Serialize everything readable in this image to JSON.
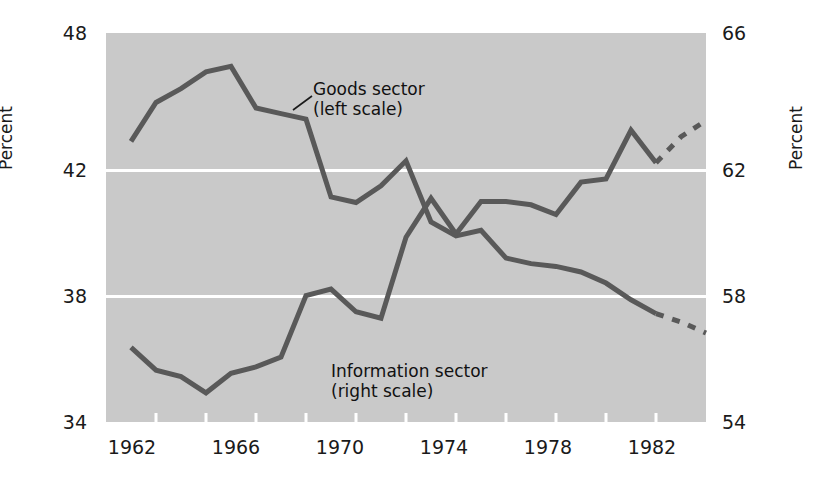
{
  "chart_data": {
    "type": "line",
    "title": "",
    "xlabel": "",
    "ylabel": "Percent",
    "ylabel_right": "Percent",
    "xlim": [
      1962,
      1986
    ],
    "ylim_left": [
      34,
      48
    ],
    "ylim_right": [
      54,
      66
    ],
    "grid": true,
    "gridlines_left": [
      42,
      38
    ],
    "legend": "inline annotations",
    "x_ticks_labeled": [
      "1962",
      "1966",
      "1970",
      "1974",
      "1978",
      "1982"
    ],
    "x_tick_values_labeled": [
      1962,
      1966,
      1970,
      1974,
      1978,
      1982
    ],
    "x_tick_interval_years": 2,
    "y_ticks_left": [
      "48",
      "42",
      "38",
      "34"
    ],
    "y_tick_values_left": [
      48,
      42,
      38,
      34
    ],
    "y_ticks_right": [
      "66",
      "62",
      "58",
      "54"
    ],
    "y_tick_values_right": [
      66,
      62,
      58,
      54
    ],
    "annotations": [
      {
        "name": "goods-sector",
        "line1": "Goods sector",
        "line2": "(left scale)"
      },
      {
        "name": "information-sector",
        "line1": "Information sector",
        "line2": "(right scale)"
      }
    ],
    "colors": {
      "plot_background": "#c9c9c9",
      "gridline": "#ffffff",
      "series_line": "#595959",
      "text": "#1a1a1a",
      "page_background": "#ffffff"
    },
    "series": [
      {
        "name": "Goods sector",
        "scale": "left",
        "axis_label": "Percent",
        "style": "solid",
        "x": [
          1963,
          1964,
          1965,
          1966,
          1967,
          1968,
          1969,
          1970,
          1971,
          1972,
          1973,
          1974,
          1975,
          1976,
          1977,
          1978,
          1979,
          1980,
          1981,
          1982,
          1983,
          1984
        ],
        "values": [
          44.1,
          45.5,
          46.0,
          46.6,
          46.8,
          45.3,
          45.1,
          44.9,
          42.1,
          41.9,
          42.5,
          43.4,
          41.2,
          40.7,
          40.9,
          39.9,
          39.7,
          39.6,
          39.4,
          39.0,
          38.4,
          37.9
        ]
      },
      {
        "name": "Goods sector (projected)",
        "scale": "left",
        "style": "dashed",
        "x": [
          1984,
          1985,
          1986
        ],
        "values": [
          37.9,
          37.6,
          37.2
        ]
      },
      {
        "name": "Information sector",
        "scale": "right",
        "axis_label": "Percent",
        "style": "solid",
        "x": [
          1963,
          1964,
          1965,
          1966,
          1967,
          1968,
          1969,
          1970,
          1971,
          1972,
          1973,
          1974,
          1975,
          1976,
          1977,
          1978,
          1979,
          1980,
          1981,
          1982,
          1983,
          1984
        ],
        "values": [
          56.3,
          55.6,
          55.4,
          54.9,
          55.5,
          55.7,
          56.0,
          57.9,
          58.1,
          57.4,
          57.2,
          59.7,
          60.9,
          59.8,
          60.8,
          60.8,
          60.7,
          60.4,
          61.4,
          61.5,
          63.0,
          62.0
        ]
      },
      {
        "name": "Information sector (projected)",
        "scale": "right",
        "style": "dashed",
        "x": [
          1984,
          1985,
          1986
        ],
        "values": [
          62.0,
          62.8,
          63.3
        ]
      }
    ]
  },
  "axes": {
    "left_title": "Percent",
    "right_title": "Percent",
    "y_left": [
      {
        "label": "48",
        "value": 48
      },
      {
        "label": "42",
        "value": 42
      },
      {
        "label": "38",
        "value": 38
      },
      {
        "label": "34",
        "value": 34
      }
    ],
    "y_right": [
      {
        "label": "66",
        "value": 66
      },
      {
        "label": "62",
        "value": 62
      },
      {
        "label": "58",
        "value": 58
      },
      {
        "label": "54",
        "value": 54
      }
    ],
    "x": [
      {
        "label": "1962",
        "value": 1962
      },
      {
        "label": "1966",
        "value": 1966
      },
      {
        "label": "1970",
        "value": 1970
      },
      {
        "label": "1974",
        "value": 1974
      },
      {
        "label": "1978",
        "value": 1978
      },
      {
        "label": "1982",
        "value": 1982
      }
    ]
  },
  "annotations": {
    "goods": {
      "line1": "Goods sector",
      "line2": "(left scale)"
    },
    "information": {
      "line1": "Information sector",
      "line2": "(right scale)"
    }
  }
}
